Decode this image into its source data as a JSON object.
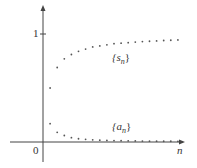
{
  "chart_data": {
    "type": "scatter",
    "title": "",
    "xlabel": "n",
    "ylabel": "",
    "y_ticks": [
      "0",
      "1"
    ],
    "grid": false,
    "legend_position": "inline",
    "series": [
      {
        "name": "{s_n}",
        "label_text": "{s",
        "label_sub": "n",
        "x": [
          1,
          2,
          3,
          4,
          5,
          6,
          7,
          8,
          9,
          10,
          11,
          12,
          13,
          14,
          15,
          16,
          17,
          18,
          19
        ],
        "values": [
          0.5,
          0.69,
          0.77,
          0.81,
          0.84,
          0.86,
          0.88,
          0.89,
          0.9,
          0.91,
          0.915,
          0.92,
          0.925,
          0.93,
          0.933,
          0.936,
          0.94,
          0.942,
          0.945
        ]
      },
      {
        "name": "{a_n}",
        "label_text": "{a",
        "label_sub": "n",
        "x": [
          1,
          2,
          3,
          4,
          5,
          6,
          7,
          8,
          9,
          10,
          11,
          12,
          13,
          14,
          15,
          16,
          17,
          18,
          19
        ],
        "values": [
          0.17,
          0.09,
          0.06,
          0.04,
          0.03,
          0.025,
          0.02,
          0.017,
          0.015,
          0.013,
          0.012,
          0.011,
          0.01,
          0.009,
          0.008,
          0.008,
          0.007,
          0.007,
          0.006
        ]
      }
    ],
    "ylim": [
      -0.1,
      1.3
    ]
  },
  "labels": {
    "zero": "0",
    "one": "1",
    "xaxis": "n",
    "close": "}"
  }
}
